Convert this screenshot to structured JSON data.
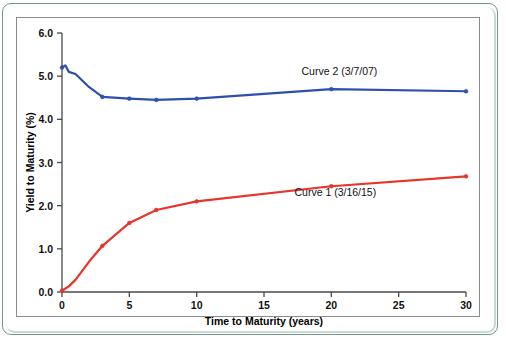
{
  "figure": {
    "frame_color": "#6e998c",
    "panel_border_color": "#8c8c8c",
    "background": "#ffffff",
    "bleed_through_artifact": true
  },
  "chart_data": {
    "type": "line",
    "title": "",
    "xlabel": "Time to Maturity (years)",
    "ylabel": "Yield to Maturity (%)",
    "xlim": [
      0,
      30
    ],
    "ylim": [
      0,
      6
    ],
    "xticks": [
      0,
      5,
      10,
      15,
      20,
      25,
      30
    ],
    "xtick_labels": [
      "0",
      "5",
      "10",
      "15",
      "20",
      "25",
      "30"
    ],
    "yticks": [
      0,
      1,
      2,
      3,
      4,
      5,
      6
    ],
    "ytick_labels": [
      "0.0",
      "1.0",
      "2.0",
      "3.0",
      "4.0",
      "5.0",
      "6.0"
    ],
    "grid": false,
    "legend_position": "inline-right-of-curve",
    "series": [
      {
        "name": "Curve 2 (3/7/07)",
        "color": "#2d4fae",
        "label_x": 20.6,
        "label_y": 5.02,
        "x": [
          0,
          0.25,
          0.5,
          1,
          2,
          3,
          5,
          7,
          10,
          20,
          30
        ],
        "y": [
          5.2,
          5.25,
          5.1,
          5.05,
          4.75,
          4.52,
          4.48,
          4.45,
          4.48,
          4.7,
          4.65
        ]
      },
      {
        "name": "Curve 1 (3/16/15)",
        "color": "#e8342b",
        "label_x": 20.3,
        "label_y": 2.22,
        "x": [
          0,
          0.25,
          0.5,
          1,
          2,
          3,
          5,
          7,
          10,
          20,
          30
        ],
        "y": [
          0.03,
          0.08,
          0.13,
          0.28,
          0.7,
          1.07,
          1.6,
          1.9,
          2.1,
          2.45,
          2.68
        ]
      }
    ]
  }
}
